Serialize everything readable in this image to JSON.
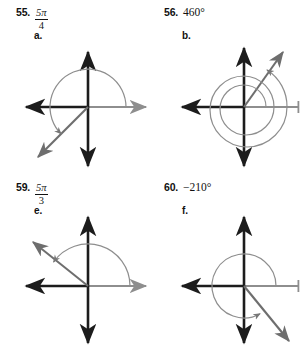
{
  "page": {
    "kind": "math-worksheet-angle-diagrams",
    "background_color": "#ffffff",
    "axis_dark_color": "#1c1c1c",
    "axis_gray_color": "#8e8e8e",
    "arc_color": "#8e8e8e",
    "ray_color": "#6e6e6e"
  },
  "problems": [
    {
      "number": "55.",
      "value_type": "fraction",
      "numerator": "5π",
      "denominator": "4",
      "value_text": "5π/4",
      "letter": "a.",
      "diagram": {
        "terminal_angle_deg": 225,
        "arc_start_deg": 0,
        "arc_sweep_deg": 225,
        "direction": "counterclockwise",
        "turns": 1,
        "quadrant": 3
      }
    },
    {
      "number": "56.",
      "value_type": "degrees",
      "value_text": "460°",
      "letter": "b.",
      "diagram": {
        "terminal_angle_deg": 100,
        "arc_start_deg": 0,
        "arc_sweep_deg": 460,
        "direction": "counterclockwise",
        "turns": 2,
        "quadrant": 1
      }
    },
    {
      "number": "59.",
      "value_type": "fraction",
      "numerator": "5π",
      "denominator": "3",
      "value_text": "5π/3",
      "letter": "e.",
      "diagram": {
        "terminal_angle_deg": 145,
        "arc_start_deg": 0,
        "arc_sweep_deg": 145,
        "direction": "counterclockwise",
        "turns": 1,
        "quadrant": 2
      }
    },
    {
      "number": "60.",
      "value_type": "degrees",
      "value_text": "−210°",
      "letter": "f.",
      "diagram": {
        "terminal_angle_deg": 300,
        "arc_start_deg": 0,
        "arc_sweep_deg": 300,
        "direction": "counterclockwise",
        "turns": 1,
        "quadrant": 4
      }
    }
  ]
}
